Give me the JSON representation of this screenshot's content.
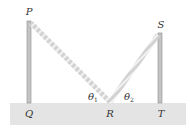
{
  "diagram": {
    "colors": {
      "ground": "#e4e4e4",
      "pole": "#bdbdbd",
      "pole_edge": "#8a8a8a",
      "rope": "#d6d6d6",
      "rope_stripe": "#f4f4f4",
      "text": "#333333"
    },
    "labels": {
      "P": "P",
      "Q": "Q",
      "R": "R",
      "S": "S",
      "T": "T",
      "theta1": "θ",
      "theta1_sub": "1",
      "theta2": "θ",
      "theta2_sub": "2"
    }
  }
}
